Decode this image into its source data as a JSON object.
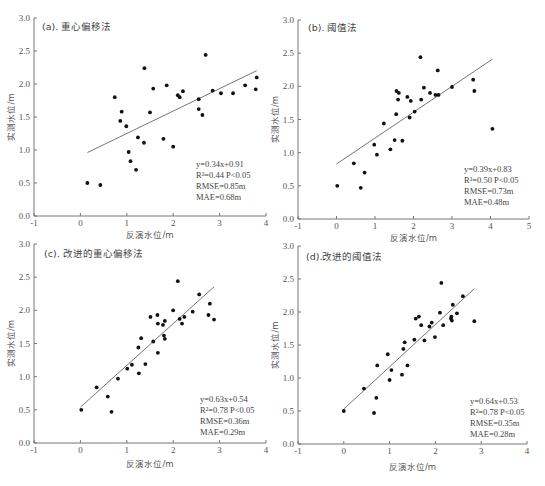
{
  "chart_data": [
    {
      "type": "scatter",
      "title": "(a). 重心偏移法",
      "xlabel": "反演水位/m",
      "ylabel": "实测水位/m",
      "xlim": [
        -1,
        4
      ],
      "ylim": [
        0,
        3.0
      ],
      "xticks": [
        "-1",
        "0",
        "1",
        "2",
        "3",
        "4"
      ],
      "yticks": [
        "0.0",
        "0.5",
        "1.0",
        "1.5",
        "2.0",
        "2.5",
        "3.0"
      ],
      "grid": false,
      "fit": {
        "slope": 0.34,
        "intercept": 0.91,
        "x_range": [
          0.15,
          3.8
        ]
      },
      "stats": [
        "y=0.34x+0.91",
        "R²=0.44  P<0.05",
        "RMSE=0.85m",
        "MAE=0.68m"
      ],
      "points": [
        [
          0.15,
          0.5
        ],
        [
          0.43,
          0.47
        ],
        [
          0.74,
          1.8
        ],
        [
          0.86,
          1.44
        ],
        [
          0.89,
          1.58
        ],
        [
          0.99,
          1.36
        ],
        [
          1.04,
          0.97
        ],
        [
          1.08,
          0.83
        ],
        [
          1.2,
          0.7
        ],
        [
          1.24,
          1.19
        ],
        [
          1.37,
          1.11
        ],
        [
          1.38,
          2.24
        ],
        [
          1.5,
          1.57
        ],
        [
          1.57,
          1.93
        ],
        [
          1.79,
          1.17
        ],
        [
          1.86,
          1.98
        ],
        [
          2.0,
          1.05
        ],
        [
          2.1,
          1.83
        ],
        [
          2.14,
          1.8
        ],
        [
          2.21,
          1.89
        ],
        [
          2.55,
          1.77
        ],
        [
          2.55,
          1.62
        ],
        [
          2.63,
          1.53
        ],
        [
          2.7,
          2.44
        ],
        [
          2.85,
          1.9
        ],
        [
          3.03,
          1.86
        ],
        [
          3.29,
          1.86
        ],
        [
          3.55,
          1.98
        ],
        [
          3.78,
          1.92
        ],
        [
          3.8,
          2.1
        ]
      ]
    },
    {
      "type": "scatter",
      "title": "(b). 阈值法",
      "xlabel": "反演水位/m",
      "ylabel": "实测水位/m",
      "xlim": [
        -1,
        5
      ],
      "ylim": [
        0,
        3.0
      ],
      "xticks": [
        "-1",
        "0",
        "1",
        "2",
        "3",
        "4",
        "5"
      ],
      "yticks": [
        "0.0",
        "0.5",
        "1.0",
        "1.5",
        "2.0",
        "2.5",
        "3.0"
      ],
      "grid": false,
      "fit": {
        "slope": 0.39,
        "intercept": 0.83,
        "x_range": [
          0.0,
          4.05
        ]
      },
      "stats": [
        "y=0.39x+0.83",
        "R²=0.50  P<0.05",
        "RMSE=0.73m",
        "MAE=0.48m"
      ],
      "points": [
        [
          0.02,
          0.5
        ],
        [
          0.45,
          0.84
        ],
        [
          0.63,
          0.47
        ],
        [
          0.73,
          0.7
        ],
        [
          0.98,
          1.12
        ],
        [
          1.05,
          0.97
        ],
        [
          1.23,
          1.44
        ],
        [
          1.4,
          1.05
        ],
        [
          1.51,
          1.19
        ],
        [
          1.55,
          1.58
        ],
        [
          1.56,
          1.93
        ],
        [
          1.6,
          1.8
        ],
        [
          1.62,
          1.9
        ],
        [
          1.71,
          1.18
        ],
        [
          1.84,
          1.84
        ],
        [
          1.9,
          1.53
        ],
        [
          1.93,
          1.78
        ],
        [
          2.03,
          1.62
        ],
        [
          2.18,
          2.44
        ],
        [
          2.2,
          1.8
        ],
        [
          2.27,
          1.98
        ],
        [
          2.43,
          1.9
        ],
        [
          2.57,
          1.87
        ],
        [
          2.63,
          2.24
        ],
        [
          2.65,
          1.87
        ],
        [
          3.0,
          1.99
        ],
        [
          3.55,
          2.1
        ],
        [
          3.58,
          1.93
        ],
        [
          4.05,
          1.36
        ]
      ]
    },
    {
      "type": "scatter",
      "title": "(c). 改进的重心偏移法",
      "xlabel": "反演水位/m",
      "ylabel": "实测水位/m",
      "xlim": [
        -1,
        4
      ],
      "ylim": [
        0,
        3.0
      ],
      "xticks": [
        "-1",
        "0",
        "1",
        "2",
        "3",
        "4"
      ],
      "yticks": [
        "0.0",
        "0.5",
        "1.0",
        "1.5",
        "2.0",
        "2.5",
        "3.0"
      ],
      "grid": false,
      "fit": {
        "slope": 0.63,
        "intercept": 0.54,
        "x_range": [
          0.0,
          2.88
        ]
      },
      "stats": [
        "y=0.63x+0.54",
        "R²=0.78  P<0.05",
        "RMSE=0.36m",
        "MAE=0.29m"
      ],
      "points": [
        [
          0.02,
          0.5
        ],
        [
          0.35,
          0.84
        ],
        [
          0.59,
          0.7
        ],
        [
          0.67,
          0.47
        ],
        [
          0.81,
          0.97
        ],
        [
          1.01,
          1.12
        ],
        [
          1.11,
          1.18
        ],
        [
          1.25,
          1.44
        ],
        [
          1.26,
          1.05
        ],
        [
          1.31,
          1.58
        ],
        [
          1.4,
          1.19
        ],
        [
          1.51,
          1.9
        ],
        [
          1.57,
          1.53
        ],
        [
          1.66,
          1.93
        ],
        [
          1.67,
          1.8
        ],
        [
          1.67,
          1.36
        ],
        [
          1.78,
          1.78
        ],
        [
          1.8,
          1.62
        ],
        [
          1.82,
          1.57
        ],
        [
          1.82,
          1.84
        ],
        [
          2.0,
          2.0
        ],
        [
          2.1,
          2.44
        ],
        [
          2.14,
          1.87
        ],
        [
          2.19,
          1.8
        ],
        [
          2.24,
          1.9
        ],
        [
          2.42,
          1.98
        ],
        [
          2.56,
          2.24
        ],
        [
          2.76,
          1.93
        ],
        [
          2.79,
          2.1
        ],
        [
          2.88,
          1.86
        ]
      ]
    },
    {
      "type": "scatter",
      "title": "(d).改进的阈值法",
      "xlabel": "反演水位/m",
      "ylabel": "实测水位/m",
      "xlim": [
        -1,
        4
      ],
      "ylim": [
        0,
        3.0
      ],
      "xticks": [
        "-1",
        "0",
        "1",
        "2",
        "3",
        "4"
      ],
      "yticks": [
        "0.0",
        "0.5",
        "1.0",
        "1.5",
        "2.0",
        "2.5",
        "3.0"
      ],
      "grid": false,
      "fit": {
        "slope": 0.64,
        "intercept": 0.53,
        "x_range": [
          0.0,
          2.85
        ]
      },
      "stats": [
        "y=0.64x+0.53",
        "R²=0.78  P<0.05",
        "RMSE=0.35m",
        "MAE=0.28m"
      ],
      "points": [
        [
          0.0,
          0.5
        ],
        [
          0.44,
          0.84
        ],
        [
          0.66,
          0.47
        ],
        [
          0.71,
          0.7
        ],
        [
          0.73,
          1.19
        ],
        [
          0.96,
          1.36
        ],
        [
          1.0,
          0.97
        ],
        [
          1.04,
          1.12
        ],
        [
          1.27,
          1.05
        ],
        [
          1.3,
          1.44
        ],
        [
          1.33,
          1.54
        ],
        [
          1.39,
          1.19
        ],
        [
          1.54,
          1.58
        ],
        [
          1.57,
          1.9
        ],
        [
          1.64,
          1.93
        ],
        [
          1.69,
          1.8
        ],
        [
          1.76,
          1.57
        ],
        [
          1.87,
          1.78
        ],
        [
          1.92,
          1.84
        ],
        [
          1.99,
          1.62
        ],
        [
          2.1,
          1.99
        ],
        [
          2.13,
          2.44
        ],
        [
          2.17,
          1.8
        ],
        [
          2.34,
          1.9
        ],
        [
          2.35,
          1.93
        ],
        [
          2.36,
          1.87
        ],
        [
          2.38,
          2.11
        ],
        [
          2.47,
          1.98
        ],
        [
          2.6,
          2.24
        ],
        [
          2.85,
          1.86
        ]
      ]
    }
  ],
  "panels_layout": [
    {
      "x0": 34,
      "x1": 266,
      "y0": 216,
      "y1": 18,
      "title_x": 42,
      "title_y": 30,
      "stats_x": 196,
      "stats_y": 167,
      "xlabel_y": 238,
      "ylabel_x": 14
    },
    {
      "x0": 298,
      "x1": 529,
      "y0": 219,
      "y1": 20,
      "title_x": 308,
      "title_y": 31,
      "stats_x": 464,
      "stats_y": 172,
      "xlabel_y": 241,
      "ylabel_x": 278
    },
    {
      "x0": 34,
      "x1": 266,
      "y0": 443,
      "y1": 244,
      "title_x": 44,
      "title_y": 257,
      "stats_x": 200,
      "stats_y": 402,
      "xlabel_y": 467,
      "ylabel_x": 14
    },
    {
      "x0": 298,
      "x1": 527,
      "y0": 444,
      "y1": 246,
      "title_x": 306,
      "title_y": 260,
      "stats_x": 470,
      "stats_y": 404,
      "xlabel_y": 470,
      "ylabel_x": 278
    }
  ]
}
